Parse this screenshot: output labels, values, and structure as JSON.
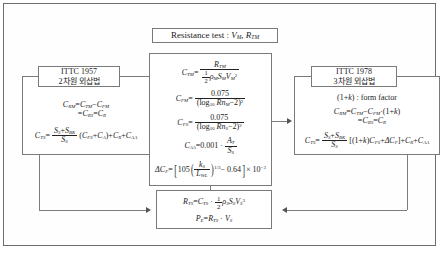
{
  "diagram": {
    "title_box": {
      "label_prefix": "Resistance  test :",
      "var1": "V",
      "var1_sub": "M",
      "sep": ",",
      "var2": "R",
      "var2_sub": "TM"
    },
    "center_box": {
      "eq1": {
        "lhs": "C",
        "lhs_sub": "TM",
        "eq": "=",
        "num": "R",
        "num_sub": "TM",
        "den_half": "1/2",
        "den_rho": "ρ",
        "den_rho_sub": "M",
        "den_s": "S",
        "den_s_sub": "M",
        "den_v": "V",
        "den_v_sub": "M",
        "den_v_sup": "2"
      },
      "eq2": {
        "lhs": "C",
        "lhs_sub": "FM",
        "eq": "=",
        "num": "0.075",
        "den_log": "log",
        "den_log_sub": "10",
        "den_rn": "Rn",
        "den_rn_sub": "M",
        "den_minus": "−2",
        "den_sup": "2"
      },
      "eq3": {
        "lhs": "C",
        "lhs_sub": "FS",
        "eq": "=",
        "num": "0.075",
        "den_log": "log",
        "den_log_sub": "10",
        "den_rn": "Rn",
        "den_rn_sub": "S",
        "den_minus": "−2",
        "den_sup": "2"
      },
      "eq4": {
        "lhs": "C",
        "lhs_sub": "AA",
        "eq": "=",
        "value": "0.001",
        "dot": "·",
        "num": "A",
        "num_sub": "T",
        "den": "S",
        "den_sub": "S"
      },
      "eq5": {
        "lhs": "ΔC",
        "lhs_sub": "F",
        "eq": "=",
        "coef": "105",
        "num": "k",
        "num_sub": "S",
        "den": "L",
        "den_sub": "WL",
        "exp": "1/3",
        "minus": "− 0.64",
        "times": "× 10",
        "times_sup": "−3"
      }
    },
    "left": {
      "header_line1": "ITTC 1957",
      "header_line2": "2차원  외삽법",
      "eq1_line1": {
        "lhs": "C",
        "lhs_sub": "RM",
        "eq": "=",
        "t1": "C",
        "t1_sub": "TM",
        "op": "−",
        "t2": "C",
        "t2_sub": "FM"
      },
      "eq1_line2": {
        "eq": "=",
        "t1": "C",
        "t1_sub": "RS",
        "eq2": "=",
        "t2": "C",
        "t2_sub": "R"
      },
      "eq2": {
        "lhs": "C",
        "lhs_sub": "TS",
        "eq": "=",
        "num_a": "S",
        "num_a_sub": "S",
        "plus": "+",
        "num_b": "S",
        "num_b_sub": "BK",
        "den": "S",
        "den_sub": "S",
        "t1": "C",
        "t1_sub": "FS",
        "t2": "C",
        "t2_sub": "A",
        "t3": "C",
        "t3_sub": "R",
        "t4": "C",
        "t4_sub": "AA"
      }
    },
    "right": {
      "header_line1": "ITTC 1978",
      "header_line2": "3차원  외삽법",
      "form_factor": {
        "pre": "(1+",
        "k": "k",
        "post": ") : form  factor"
      },
      "eq1_line1": {
        "lhs": "C",
        "lhs_sub": "RM",
        "eq": "=",
        "t1": "C",
        "t1_sub": "TM",
        "op": "−",
        "t2": "C",
        "t2_sub": "FM",
        "dot": "·",
        "factor": "(1+",
        "factor_k": "k",
        "factor_end": ")"
      },
      "eq1_line2": {
        "eq": "=",
        "t1": "C",
        "t1_sub": "RS",
        "eq2": "=",
        "t2": "C",
        "t2_sub": "R"
      },
      "eq2": {
        "lhs": "C",
        "lhs_sub": "TS",
        "eq": "=",
        "num_a": "S",
        "num_a_sub": "S",
        "plus": "+",
        "num_b": "S",
        "num_b_sub": "BK",
        "den": "S",
        "den_sub": "S",
        "br_open": "[(1+",
        "br_k": "k",
        "br_mid": ")",
        "t1": "C",
        "t1_sub": "FS",
        "plus2": "+",
        "d": "ΔC",
        "d_sub": "F",
        "br_close": "]",
        "t3": "C",
        "t3_sub": "R",
        "t4": "C",
        "t4_sub": "AA"
      }
    },
    "bottom": {
      "eq1": {
        "lhs": "R",
        "lhs_sub": "TS",
        "eq": "=",
        "t1": "C",
        "t1_sub": "TS",
        "dot": "·",
        "half": "1/2",
        "rho": "ρ",
        "rho_sub": "S",
        "s": "S",
        "s_sub": "S",
        "v": "V",
        "v_sub": "S",
        "v_sup": "3"
      },
      "eq2": {
        "lhs": "P",
        "lhs_sub": "E",
        "eq": "=",
        "t1": "R",
        "t1_sub": "TS",
        "dot": "·",
        "v": "V",
        "v_sub": "S"
      }
    }
  },
  "colors": {
    "frame_border": "#6d6d6d",
    "box_border": "#7a7a7a",
    "connector": "#7d7d7d",
    "text": "#1a1a1a",
    "background": "#ffffff"
  }
}
